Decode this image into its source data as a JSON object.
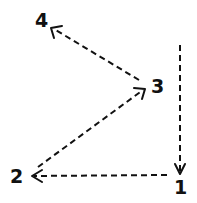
{
  "diagram": {
    "type": "numbered-path",
    "stroke_color": "#111111",
    "background": "#ffffff",
    "nodes": [
      {
        "id": "1",
        "label": "1"
      },
      {
        "id": "2",
        "label": "2"
      },
      {
        "id": "3",
        "label": "3"
      },
      {
        "id": "4",
        "label": "4"
      }
    ],
    "edges": [
      {
        "from": "start",
        "to": "1",
        "style": "dashed",
        "direction": "down"
      },
      {
        "from": "1",
        "to": "2",
        "style": "dashed",
        "direction": "left"
      },
      {
        "from": "2",
        "to": "3",
        "style": "dashed",
        "direction": "up-right"
      },
      {
        "from": "3",
        "to": "4",
        "style": "dashed",
        "direction": "up-left"
      }
    ]
  }
}
